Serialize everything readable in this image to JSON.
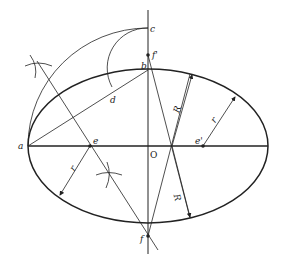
{
  "diagram": {
    "points": {
      "a": "a",
      "b": "b",
      "c": "c",
      "d": "d",
      "e": "e",
      "e_prime": "e'",
      "f": "f",
      "f_prime": "f'",
      "O": "O"
    },
    "dimensions": {
      "R_upper": "R",
      "R_lower": "R",
      "r_right": "r",
      "r_left": "r"
    },
    "colors": {
      "line": "#222222",
      "background": "#ffffff"
    }
  }
}
